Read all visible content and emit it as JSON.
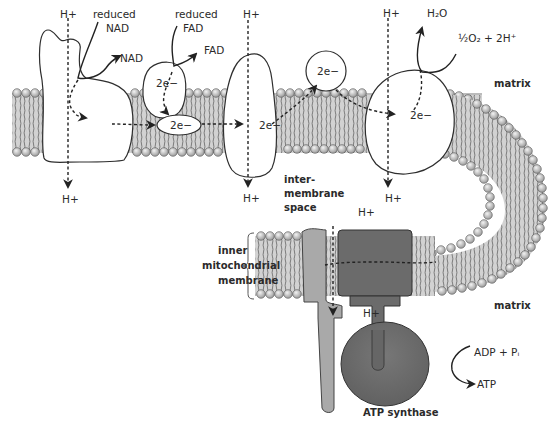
{
  "diagram": {
    "labels": {
      "h_plus": "H+",
      "reduced_nad_line1": "reduced",
      "reduced_nad_line2": "NAD",
      "nad": "NAD",
      "reduced_fad_line1": "reduced",
      "reduced_fad_line2": "FAD",
      "fad": "FAD",
      "two_e": "2e−",
      "h2o": "H₂O",
      "oxygen_eq": "½O₂ + 2H⁺",
      "matrix_top": "matrix",
      "matrix_bottom": "matrix",
      "intermembrane_line1": "inter-",
      "intermembrane_line2": "membrane",
      "intermembrane_line3": "space",
      "inner_line1": "inner",
      "inner_line2": "mitochondrial",
      "inner_line3": "membrane",
      "adp_pi": "ADP + Pᵢ",
      "atp": "ATP",
      "atp_synthase": "ATP synthase"
    },
    "colors": {
      "membrane_fill": "#cfcfcf",
      "lipid_head": "#b8b8b8",
      "atp_synthase_dark": "#6b6b6b",
      "atp_synthase_light": "#a9a9a9",
      "outline": "#2e2e2e"
    }
  }
}
